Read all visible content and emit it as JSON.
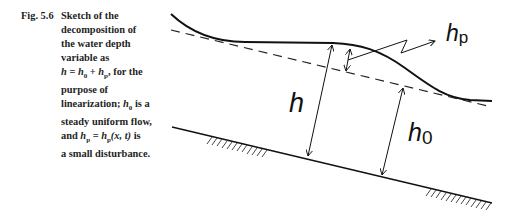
{
  "caption": {
    "label": "Fig. 5.6",
    "lines": [
      "Sketch of the",
      "decomposition of",
      "the water depth",
      "variable as",
      "h = h0 + hp, for the",
      "purpose of",
      "linearization; h0 is a",
      "steady uniform flow,",
      "and hp = hp(x, t) is",
      "a small disturbance."
    ],
    "math": {
      "line5": {
        "h": "h",
        "eq": " = ",
        "h0": "h",
        "sub0": "0",
        "plus": " + ",
        "hp": "h",
        "subp": "p",
        "rest": ", for the"
      },
      "line7": {
        "prefix": "linearization; ",
        "h0": "h",
        "sub0": "0",
        "rest": " is a"
      },
      "line9": {
        "prefix": "and ",
        "hp": "h",
        "subp": "p",
        "eq": " = ",
        "hp2": "h",
        "subp2": "p",
        "args": "(x, t)",
        "rest": " is"
      }
    }
  },
  "figure": {
    "labels": {
      "h": "h",
      "h0_base": "h",
      "h0_sub": "0",
      "hp_base": "h",
      "hp_sub": "p"
    },
    "elements": [
      "free-surface-curve",
      "uniform-flow-dashed-line",
      "channel-bed-line",
      "bed-hatching-left",
      "bed-hatching-right",
      "depth-arrow-h",
      "depth-arrow-h0",
      "disturbance-arrow-hp",
      "leader-zigzag-arrow"
    ]
  }
}
